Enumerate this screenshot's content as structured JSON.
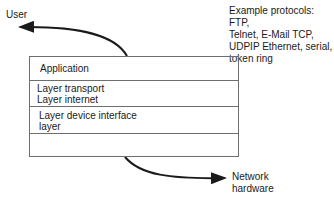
{
  "user_label": "User",
  "protocols_note": [
    "Example protocols: FTP,",
    "Telnet, E-Mail TCP,",
    "UDPIP Ethernet, serial,",
    "token ring"
  ],
  "layers": [
    {
      "lines": [
        "Application"
      ]
    },
    {
      "lines": [
        "Layer transport",
        "Layer internet"
      ]
    },
    {
      "lines": [
        "Layer device interface",
        "layer"
      ]
    },
    {
      "lines": [
        ""
      ]
    }
  ],
  "network_label": [
    "Network",
    "hardware"
  ],
  "colors": {
    "line": "#6e6e6e",
    "arrow": "#1a1a1a",
    "text": "#1a1a1a"
  }
}
